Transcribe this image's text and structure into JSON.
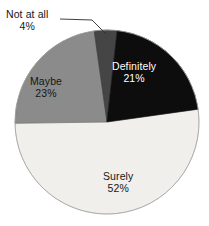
{
  "chart_data": {
    "type": "pie",
    "title": "",
    "subtitle": "",
    "xlabel": "",
    "ylabel": "",
    "legend_position": "none",
    "grid": false,
    "labels_inside_slices": true,
    "start_angle_deg": -8,
    "direction": "clockwise",
    "categories": [
      "Not at all",
      "Definitely",
      "Surely",
      "Maybe"
    ],
    "values": [
      4,
      21,
      52,
      23
    ],
    "value_unit": "%",
    "slices": [
      {
        "label": "Not at all",
        "value": 4,
        "value_text": "4%",
        "color": "#454545",
        "label_placement": "outside",
        "label_color": "#161616",
        "has_leader_line": true
      },
      {
        "label": "Definitely",
        "value": 21,
        "value_text": "21%",
        "color": "#0d0d0d",
        "label_placement": "inside",
        "label_color": "#ffffff",
        "has_leader_line": false
      },
      {
        "label": "Surely",
        "value": 52,
        "value_text": "52%",
        "color": "#f0efec",
        "label_placement": "inside",
        "label_color": "#161616",
        "has_leader_line": false
      },
      {
        "label": "Maybe",
        "value": 23,
        "value_text": "23%",
        "color": "#8b8b8b",
        "label_placement": "inside",
        "label_color": "#161616",
        "has_leader_line": false
      }
    ],
    "outline_color": "#9a9a9a",
    "background_color": "#ffffff"
  },
  "labels": {
    "definitely": {
      "name": "Definitely",
      "value": "21%"
    },
    "maybe": {
      "name": "Maybe",
      "value": "23%"
    },
    "surely": {
      "name": "Surely",
      "value": "52%"
    },
    "not_at_all": {
      "name": "Not at all",
      "value": "4%"
    }
  }
}
